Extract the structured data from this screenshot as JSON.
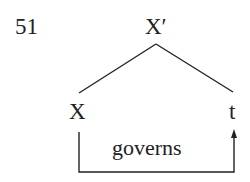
{
  "example_number": "51",
  "tree": {
    "root": "X′",
    "left_child": "X",
    "right_child": "t"
  },
  "relation": {
    "label": "governs",
    "from": "X",
    "to": "t"
  },
  "colors": {
    "ink": "#222222",
    "background": "#ffffff"
  }
}
